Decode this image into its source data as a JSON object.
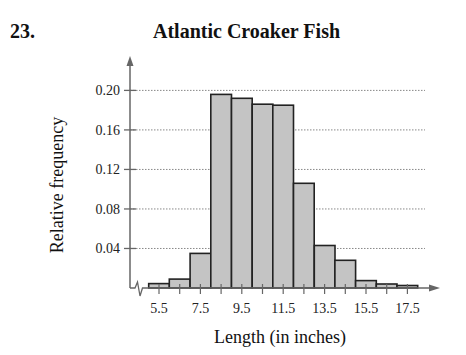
{
  "header": {
    "problem_number": "23.",
    "title": "Atlantic Croaker Fish"
  },
  "colors": {
    "bar_fill": "#c4c4c4",
    "bar_stroke": "#222222",
    "axis": "#666666",
    "grid": "#888888"
  },
  "chart_data": {
    "type": "bar",
    "title": "Atlantic Croaker Fish",
    "xlabel": "Length (in inches)",
    "ylabel": "Relative frequency",
    "categories": [
      "5.5",
      "6.5",
      "7.5",
      "8.5",
      "9.5",
      "10.5",
      "11.5",
      "12.5",
      "13.5",
      "14.5",
      "15.5",
      "16.5",
      "17.5"
    ],
    "values": [
      0.0045,
      0.009,
      0.035,
      0.196,
      0.192,
      0.186,
      0.185,
      0.106,
      0.043,
      0.028,
      0.0075,
      0.004,
      0.0025
    ],
    "x_tick_labels": [
      "5.5",
      "7.5",
      "9.5",
      "11.5",
      "13.5",
      "15.5",
      "17.5"
    ],
    "y_ticks": [
      0.04,
      0.08,
      0.12,
      0.16,
      0.2
    ],
    "y_tick_labels": [
      "0.04",
      "0.08",
      "0.12",
      "0.16",
      "0.20"
    ],
    "ylim": [
      0,
      0.22
    ],
    "grid": "horizontal dotted",
    "legend": "none",
    "histogram": true
  }
}
